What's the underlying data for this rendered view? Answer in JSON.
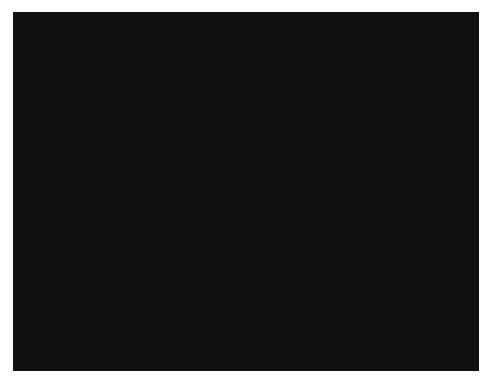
{
  "image": {
    "kind": "photograph",
    "subject": "woven-textile-swatch",
    "description": "Close-up grayscale photograph of a plain-weave fabric showing a dense checkered grid of light warp and weft yarn crossings over a dark ground",
    "color_mode": "grayscale",
    "canvas": {
      "width": 493,
      "height": 386,
      "background_color": "#ffffff"
    },
    "plate": {
      "x": 13,
      "y": 12,
      "width": 466,
      "height": 359,
      "border_color": "#ffffff"
    },
    "tonal_range": {
      "darkest": "#050505",
      "shadow": "#1a1a1a",
      "midtone": "#6b6b6b",
      "highlight": "#d8d8d8",
      "lightest": "#f2f2f2",
      "mean_level": "#4f4f4f"
    },
    "weave": {
      "pattern": "plain-weave",
      "pitch_px": 6.0,
      "warp_pitch_px": 6.0,
      "weft_pitch_px": 6.0,
      "highlight_dot_radius_px": 1.6,
      "lattice_contrast": 0.92,
      "band_period_px": 58,
      "noise_amount": 0.34,
      "blur_radius_px": 0.9
    }
  }
}
